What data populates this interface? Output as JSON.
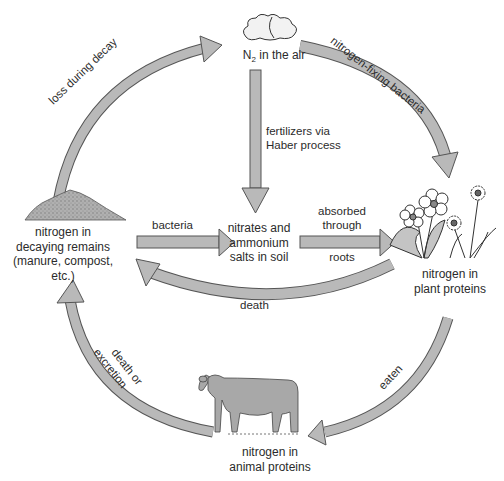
{
  "diagram": {
    "colors": {
      "arrow_fill": "#b9b9b9",
      "arrow_stroke": "#555555",
      "text": "#2b2b2b",
      "background": "#ffffff",
      "pile_fill": "#a9a9a9",
      "cow_fill": "#a8a8a8"
    },
    "nodes": {
      "air": {
        "label_main": "N",
        "label_sub": "2",
        "label_rest": " in the air",
        "icon": "cloud-icon"
      },
      "soil": {
        "line1": "nitrates and",
        "line2": "ammonium",
        "line3": "salts in soil"
      },
      "plants": {
        "line1": "nitrogen in",
        "line2": "plant proteins",
        "icon": "flowers-icon"
      },
      "animals": {
        "line1": "nitrogen in",
        "line2": "animal proteins",
        "icon": "cow-icon"
      },
      "remains": {
        "line1": "nitrogen in",
        "line2": "decaying remains",
        "line3": "(manure, compost,",
        "line4": "etc.)",
        "icon": "compost-pile-icon"
      }
    },
    "edges": {
      "loss_during_decay": "loss during decay",
      "nitrogen_fixing": "nitrogen-fixing bacteria",
      "fertilizers_line1": "fertilizers via",
      "fertilizers_line2": "Haber process",
      "bacteria": "bacteria",
      "absorbed_line1": "absorbed",
      "absorbed_line2": "through",
      "absorbed_line3": "roots",
      "death": "death",
      "eaten": "eaten",
      "death_or_line1": "death or",
      "death_or_line2": "excretion"
    }
  }
}
